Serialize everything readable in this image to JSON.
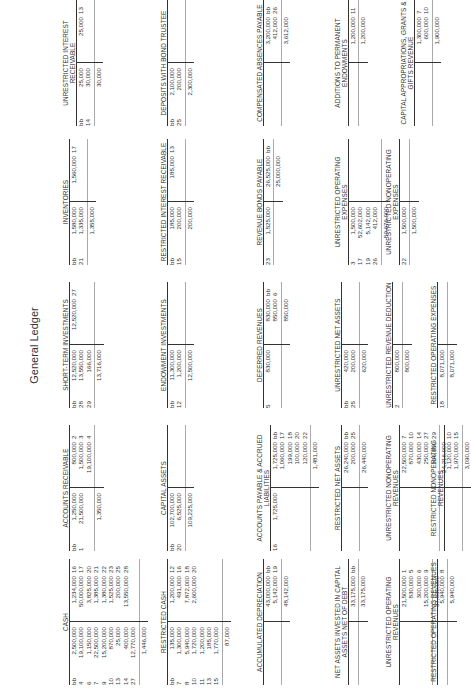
{
  "title": "General Ledger",
  "accounts": [
    {
      "name": "CASH",
      "x": 6,
      "y": 62,
      "debits": [
        [
          "bb",
          "2,500,000"
        ],
        [
          "4",
          "19,100,000"
        ],
        [
          "6",
          "1,150,000"
        ],
        [
          "7",
          "22,500,000"
        ],
        [
          "9",
          "15,200,000"
        ],
        [
          "10",
          "870,000"
        ],
        [
          "13",
          "25,000"
        ],
        [
          "14",
          "400,000"
        ],
        [
          "27",
          "12,770,000"
        ]
      ],
      "credits": [
        [
          "1,234,000",
          "16"
        ],
        [
          "50,000,000",
          "17"
        ],
        [
          "3,825,000",
          "20"
        ],
        [
          "1,385,000",
          "21"
        ],
        [
          "1,380,000",
          "22"
        ],
        [
          "1,525,000",
          "23"
        ],
        [
          "200,000",
          "25"
        ],
        [
          "13,550,000",
          "28"
        ]
      ],
      "balance_dr": "1,446,000",
      "balance_cr": "",
      "rows": 9
    },
    {
      "name": "ACCOUNTS RECEIVABLE",
      "x": 140,
      "y": 62,
      "debits": [
        [
          "bb",
          "1,250,000"
        ],
        [
          "1",
          "21,500,000"
        ]
      ],
      "credits": [
        [
          "800,000",
          "2"
        ],
        [
          "1,500,000",
          "3"
        ],
        [
          "19,100,000",
          "4"
        ]
      ],
      "balance_dr": "1,350,000",
      "balance_cr": "",
      "rows": 9
    },
    {
      "name": "SHORT-TERM INVESTMENTS",
      "x": 283,
      "y": 62,
      "debits": [
        [
          "bb",
          "12,520,000"
        ],
        [
          "28",
          "13,550,000"
        ],
        [
          "29",
          "166,000"
        ]
      ],
      "credits": [
        [
          "12,520,000",
          "27"
        ]
      ],
      "balance_dr": "13,716,000",
      "balance_cr": "",
      "rows": 9
    },
    {
      "name": "INVENTORIES",
      "x": 426,
      "y": 62,
      "debits": [
        [
          "bb",
          "1,580,000"
        ],
        [
          "21",
          "1,335,000"
        ]
      ],
      "credits": [
        [
          "1,560,000",
          "17"
        ]
      ],
      "balance_dr": "1,355,000",
      "balance_cr": "",
      "rows": 9
    },
    {
      "name": "UNRESTRICTED INTEREST RECEIVABLE",
      "x": 565,
      "y": 62,
      "debits": [
        [
          "bb",
          "25,000"
        ],
        [
          "14",
          "30,000"
        ]
      ],
      "credits": [
        [
          "25,000",
          "13"
        ]
      ],
      "balance_dr": "30,000",
      "balance_cr": "",
      "rows": 9
    },
    {
      "name": "RESTRICTED CASH",
      "x": 6,
      "y": 160,
      "debits": [
        [
          "bb",
          "135,000"
        ],
        [
          "7",
          "1,300,000"
        ],
        [
          "8",
          "5,940,000"
        ],
        [
          "10",
          "1,720,000"
        ],
        [
          "11",
          "1,200,000"
        ],
        [
          "13",
          "185,000"
        ],
        [
          "15",
          "1,770,000"
        ]
      ],
      "credits": [
        [
          "1,200,000",
          "12"
        ],
        [
          "491,000",
          "16"
        ],
        [
          "7,872,000",
          "18"
        ],
        [
          "2,600,000",
          "20"
        ]
      ],
      "balance_dr": "87,000",
      "balance_cr": "",
      "rows": 7
    },
    {
      "name": "CAPITAL ASSETS",
      "x": 140,
      "y": 160,
      "debits": [
        [
          "bb",
          "102,700,000"
        ],
        [
          "20",
          "6,525,000"
        ]
      ],
      "credits": [],
      "balance_dr": "109,225,000",
      "balance_cr": "",
      "rows": 7
    },
    {
      "name": "ENDOWMENT INVESTMENTS",
      "x": 283,
      "y": 160,
      "debits": [
        [
          "bb",
          "11,300,000"
        ],
        [
          "12",
          "1,200,000"
        ]
      ],
      "credits": [],
      "balance_dr": "12,500,000",
      "balance_cr": "",
      "rows": 7
    },
    {
      "name": "RESTRICTED INTEREST RECEIVABLE",
      "x": 426,
      "y": 160,
      "debits": [
        [
          "bb",
          "185,000"
        ],
        [
          "15",
          "200,000"
        ]
      ],
      "credits": [
        [
          "185,000",
          "13"
        ]
      ],
      "balance_dr": "200,000",
      "balance_cr": "",
      "rows": 7
    },
    {
      "name": "DEPOSITS WITH BOND TRUSTEE",
      "x": 565,
      "y": 160,
      "debits": [
        [
          "bb",
          "2,100,000"
        ],
        [
          "25",
          "200,000"
        ]
      ],
      "credits": [],
      "balance_dr": "2,300,000",
      "balance_cr": "",
      "rows": 7
    },
    {
      "name": "ACCUMULATED DEPRECIATION",
      "x": 6,
      "y": 256,
      "debits": [],
      "credits": [
        [
          "43,000,000",
          "bb"
        ],
        [
          "5,142,000",
          "19"
        ]
      ],
      "balance_dr": "",
      "balance_cr": "48,142,000",
      "rows": 6
    },
    {
      "name": "ACCOUNTS PAYABLE & ACCRUED LIABILITIES",
      "x": 140,
      "y": 256,
      "debits": [
        [
          "16",
          "1,725,000"
        ]
      ],
      "credits": [
        [
          "1,725,000",
          "bb"
        ],
        [
          "1,060,000",
          "17"
        ],
        [
          "199,000",
          "18"
        ],
        [
          "100,000",
          "20"
        ],
        [
          "120,000",
          "22"
        ]
      ],
      "balance_dr": "",
      "balance_cr": "1,481,000",
      "rows": 6
    },
    {
      "name": "DEFERRED REVENUES",
      "x": 283,
      "y": 256,
      "debits": [
        [
          "5",
          "830,000"
        ]
      ],
      "credits": [
        [
          "830,000",
          "bb"
        ],
        [
          "850,000",
          "6"
        ]
      ],
      "balance_dr": "",
      "balance_cr": "850,000",
      "rows": 6
    },
    {
      "name": "REVENUE BONDS PAYABLE",
      "x": 426,
      "y": 256,
      "debits": [
        [
          "23",
          "1,525,000"
        ]
      ],
      "credits": [
        [
          "26,525,000",
          "bb"
        ]
      ],
      "balance_dr": "",
      "balance_cr": "25,000,000",
      "rows": 6
    },
    {
      "name": "COMPENSATED ABSENCES PAYABLE",
      "x": 565,
      "y": 256,
      "debits": [],
      "credits": [
        [
          "3,200,000",
          "bb"
        ],
        [
          "412,000",
          "26"
        ]
      ],
      "balance_dr": "",
      "balance_cr": "3,612,000",
      "rows": 6
    },
    {
      "name": "NET ASSETS INVESTED IN CAPITAL ASSETS NET OF DEBT",
      "x": 6,
      "y": 334,
      "debits": [],
      "credits": [
        [
          "33,175,000",
          "bb"
        ]
      ],
      "balance_dr": "",
      "balance_cr": "33,175,000",
      "rows": 2
    },
    {
      "name": "RESTRICTED NET ASSETS",
      "x": 140,
      "y": 334,
      "debits": [],
      "credits": [
        [
          "26,240,000",
          "bb"
        ],
        [
          "200,000",
          "25"
        ]
      ],
      "balance_dr": "",
      "balance_cr": "26,440,000",
      "rows": 2
    },
    {
      "name": "UNRESTRICTED NET ASSETS",
      "x": 283,
      "y": 334,
      "debits": [
        [
          "bb",
          "420,000"
        ],
        [
          "25",
          "200,000"
        ]
      ],
      "credits": [],
      "balance_dr": "620,000",
      "balance_cr": "",
      "rows": 2
    },
    {
      "name": "UNRESTRICTED OPERATING EXPENSES",
      "x": 426,
      "y": 334,
      "debits": [
        [
          "3",
          "1,500,000"
        ],
        [
          "17",
          "52,602,000"
        ],
        [
          "19",
          "5,142,000"
        ],
        [
          "26",
          "412,000"
        ]
      ],
      "credits": [],
      "balance_dr": "59,676,000",
      "balance_cr": "",
      "rows": 4
    },
    {
      "name": "ADDITIONS TO PERMANENT ENDOWMENTS",
      "x": 565,
      "y": 334,
      "debits": [],
      "credits": [
        [
          "1,200,000",
          "11"
        ]
      ],
      "balance_dr": "",
      "balance_cr": "1,200,000",
      "rows": 2
    },
    {
      "name": "UNRESTRICTED OPERATING REVENUES",
      "x": 6,
      "y": 385,
      "debits": [],
      "credits": [
        [
          "21,500,000",
          "1"
        ],
        [
          "830,000",
          "5"
        ],
        [
          "300,000",
          "6"
        ],
        [
          "15,200,000",
          "9"
        ]
      ],
      "balance_dr": "",
      "balance_cr": "37,830,000",
      "rows": 4
    },
    {
      "name": "UNRESTRICTED NONOPERATING REVENUES",
      "x": 140,
      "y": 385,
      "debits": [],
      "credits": [
        [
          "22,500,000",
          "7"
        ],
        [
          "870,000",
          "10"
        ],
        [
          "430,000",
          "14"
        ],
        [
          "250,000",
          "27"
        ],
        [
          "166,000",
          "29"
        ]
      ],
      "balance_dr": "",
      "balance_cr": "24,216,000",
      "rows": 5
    },
    {
      "name": "UNRESTRICTED REVENUE DEDUCTION",
      "x": 283,
      "y": 385,
      "debits": [
        [
          "2",
          "800,000"
        ]
      ],
      "credits": [],
      "balance_dr": "800,000",
      "balance_cr": "",
      "rows": 2
    },
    {
      "name": "UNRESTRICTED NONOPERATING EXPENSES",
      "x": 426,
      "y": 385,
      "debits": [
        [
          "22",
          "1,500,000"
        ]
      ],
      "credits": [],
      "balance_dr": "1,500,000",
      "balance_cr": "",
      "rows": 4
    },
    {
      "name": "CAPITAL APPROPRIATIONS, GRANTS & GIFTS REVENUE",
      "x": 565,
      "y": 400,
      "debits": [],
      "credits": [
        [
          "1,300,000",
          "7"
        ],
        [
          "600,000",
          "10"
        ]
      ],
      "balance_dr": "",
      "balance_cr": "1,900,000",
      "rows": 2
    },
    {
      "name": "RESTRICTED OPERATING REVENUES",
      "x": 6,
      "y": 430,
      "debits": [],
      "credits": [
        [
          "5,940,000",
          "8"
        ]
      ],
      "balance_dr": "",
      "balance_cr": "5,940,000",
      "rows": 1
    },
    {
      "name": "RESTRICTED NONOPERATING REVENUES",
      "x": 140,
      "y": 430,
      "debits": [],
      "credits": [
        [
          "1,120,000",
          "10"
        ],
        [
          "1,970,000",
          "15"
        ]
      ],
      "balance_dr": "",
      "balance_cr": "3,090,000",
      "rows": 2
    },
    {
      "name": "RESTRICTED OPERATING EXPENSES",
      "x": 283,
      "y": 430,
      "debits": [
        [
          "18",
          "8,071,000"
        ]
      ],
      "credits": [],
      "balance_dr": "8,071,000",
      "balance_cr": "",
      "rows": 1
    }
  ]
}
